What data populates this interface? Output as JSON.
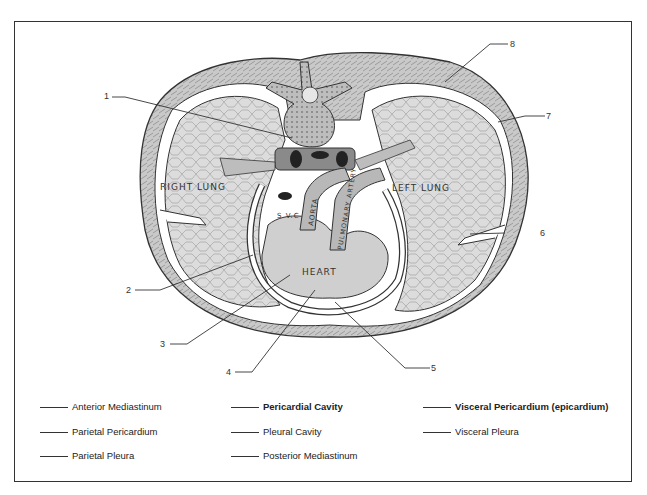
{
  "diagram": {
    "organ_labels": {
      "right_lung": "RIGHT LUNG",
      "left_lung": "LEFT LUNG",
      "heart": "HEART",
      "svc": "S.V.C",
      "aorta": "AORTA",
      "pulmonary_artery": "PULMONARY ARTERY"
    },
    "callouts": [
      {
        "number": "1"
      },
      {
        "number": "2"
      },
      {
        "number": "3"
      },
      {
        "number": "4"
      },
      {
        "number": "5"
      },
      {
        "number": "6"
      },
      {
        "number": "7"
      },
      {
        "number": "8"
      }
    ],
    "colors": {
      "lung_fill": "#d9d9d9",
      "tissue_fill": "#c8c8c8",
      "outline": "#333333",
      "cavity": "#ffffff"
    }
  },
  "legend": {
    "items": [
      {
        "label": "Anterior Mediastinum"
      },
      {
        "label": "Parietal Pericardium"
      },
      {
        "label": "Parietal Pleura"
      },
      {
        "label": "Pericardial Cavity"
      },
      {
        "label": "Pleural Cavity"
      },
      {
        "label": "Posterior Mediastinum"
      },
      {
        "label": "Visceral Pericardium (epicardium)"
      },
      {
        "label": "Visceral Pleura"
      }
    ]
  }
}
